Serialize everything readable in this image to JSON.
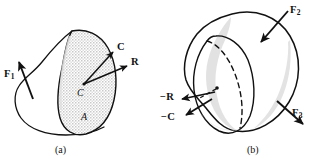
{
  "figure": {
    "caption_a": "(a)",
    "caption_b": "(b)",
    "background_color": "#ffffff",
    "line_color": "#111111",
    "shade_color": "#d0d0d0"
  },
  "panel_a": {
    "name": "two-dimensional-free-body-section",
    "labels": {
      "force_f1": "F",
      "force_f1_sub": "1",
      "couple_c": "C",
      "resultant_r": "R",
      "centroid_c": "C",
      "area_a": "A"
    }
  },
  "panel_b": {
    "name": "three-dimensional-body-with-cut-section",
    "labels": {
      "force_f2": "F",
      "force_f2_sub": "2",
      "force_f3": "F",
      "force_f3_sub": "3",
      "reaction_minus_r": "−R",
      "couple_minus_c": "−C"
    }
  }
}
